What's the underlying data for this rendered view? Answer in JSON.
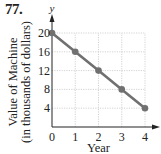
{
  "problem": {
    "number": "77."
  },
  "chart_data": {
    "type": "line",
    "title": "",
    "x": [
      0,
      1,
      2,
      3,
      4
    ],
    "series": [
      {
        "name": "Value of Machine",
        "values": [
          20,
          16,
          12,
          8,
          4
        ],
        "color": "#707070",
        "markers": true
      }
    ],
    "xlabel": "Year",
    "ylabel": "Value of Machine (in thousands of dollars)",
    "ylabel_lines": [
      "Value of Machine",
      "(in thousands of dollars)"
    ],
    "y_axis_variable": "y",
    "xticks": [
      "0",
      "1",
      "2",
      "3",
      "4"
    ],
    "yticks": [
      "4",
      "8",
      "12",
      "16",
      "20"
    ],
    "xlim": [
      0,
      4
    ],
    "ylim": [
      0,
      20
    ],
    "grid": true,
    "legend": null
  },
  "colors": {
    "line": "#707070",
    "axis": "#222222",
    "grid": "#c8c8c8"
  }
}
